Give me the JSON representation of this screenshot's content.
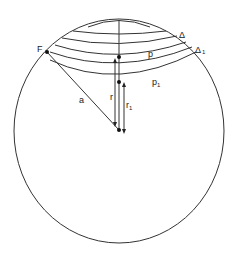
{
  "diagram": {
    "type": "geometric-figure",
    "labels": {
      "F": "F",
      "delta": "Δ",
      "delta1": "Δ",
      "delta1_sub": "1",
      "p": "p",
      "p1": "p",
      "p1_sub": "1",
      "a": "a",
      "r": "r",
      "r1": "r",
      "r1_sub": "1"
    },
    "colors": {
      "line": "#333333",
      "background": "#ffffff"
    }
  }
}
